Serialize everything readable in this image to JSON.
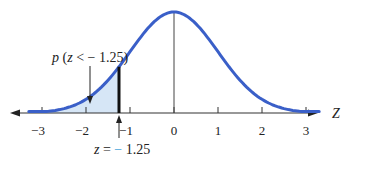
{
  "chart_data": {
    "type": "area",
    "title": "",
    "xlabel": "Z",
    "ylabel": "",
    "distribution": "standard normal",
    "mean": 0,
    "sd": 1,
    "xlim": [
      -3.3,
      3.3
    ],
    "x_ticks": [
      -3,
      -2,
      -1,
      0,
      1,
      2,
      3
    ],
    "x_tick_labels": [
      "−3",
      "−2",
      "−1",
      "0",
      "1",
      "2",
      "3"
    ],
    "shaded_region": {
      "from": -3.3,
      "to": -1.25,
      "label": "p (z < − 1.25)"
    },
    "annotations": [
      {
        "text": "p (z < − 1.25)",
        "points_to": "shaded area left of z = -1.25"
      },
      {
        "text": "z = − 1.25",
        "points_to": "x = -1.25"
      }
    ],
    "grid": false,
    "legend": null,
    "colors": {
      "curve": "#3a5fc8",
      "shade": "#d6e6f6",
      "axis": "#333333",
      "cutoff": "#111111",
      "minus_accent": "#3aa0d8"
    }
  },
  "labels": {
    "area_label": "p (z < − 1.25)",
    "z_value_prefix": "z = ",
    "z_value_sign": "−",
    "z_value_number": " 1.25",
    "axis_name": "Z",
    "ticks": [
      "−3",
      "−2",
      "−1",
      "0",
      "1",
      "2",
      "3"
    ]
  }
}
